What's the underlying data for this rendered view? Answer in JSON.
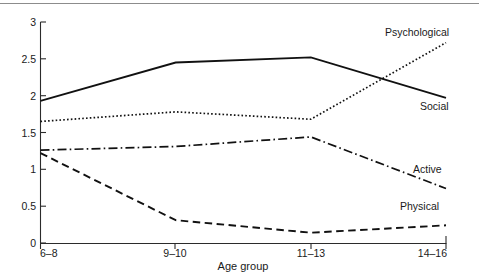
{
  "chart_data": {
    "type": "line",
    "title": "",
    "xlabel": "Age group",
    "ylabel": "",
    "categories": [
      "6–8",
      "9–10",
      "11–13",
      "14–16"
    ],
    "ylim": [
      0,
      3
    ],
    "xlim": [
      0,
      3
    ],
    "grid": false,
    "legend_position": "inline-right-of-line-ends",
    "yticks": [
      "0",
      "0.5",
      "1",
      "1.5",
      "2",
      "2.5",
      "3"
    ],
    "ytick_values": [
      0,
      0.5,
      1,
      1.5,
      2,
      2.5,
      3
    ],
    "series": [
      {
        "name": "Social",
        "style": "solid",
        "label": "Social",
        "values": [
          1.93,
          2.45,
          2.52,
          1.97
        ]
      },
      {
        "name": "Psychological",
        "style": "dotted",
        "label": "Psychological",
        "values": [
          1.65,
          1.78,
          1.68,
          2.72
        ]
      },
      {
        "name": "Active",
        "style": "dash-dot",
        "label": "Active",
        "values": [
          1.26,
          1.31,
          1.44,
          0.74
        ]
      },
      {
        "name": "Physical",
        "style": "dashed",
        "label": "Physical",
        "values": [
          1.22,
          0.31,
          0.14,
          0.24
        ]
      }
    ]
  },
  "axis": {
    "x_title": "Age group"
  }
}
